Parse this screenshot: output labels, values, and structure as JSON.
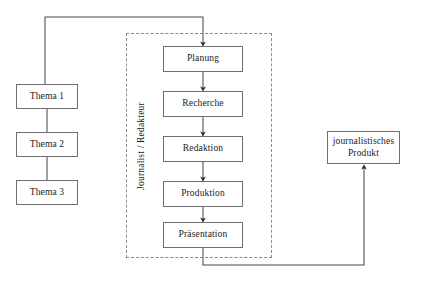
{
  "diagram": {
    "canvas": {
      "width": 425,
      "height": 283,
      "background": "#ffffff"
    },
    "style": {
      "box_stroke": "#6f6f6f",
      "connector_stroke": "#4a4a4a",
      "swimlane_stroke": "#8a8a8a",
      "text_color": "#1b1b1b"
    },
    "swimlane": {
      "label": "Journalist / Redakteur",
      "orientation": "vertical-rotated",
      "x": 126,
      "y": 33,
      "width": 146,
      "height": 225,
      "border": "dashed"
    },
    "topics": [
      {
        "id": "thema-1",
        "label": "Thema 1",
        "x": 16,
        "y": 84,
        "width": 62,
        "height": 25
      },
      {
        "id": "thema-2",
        "label": "Thema 2",
        "x": 16,
        "y": 132,
        "width": 62,
        "height": 25
      },
      {
        "id": "thema-3",
        "label": "Thema 3",
        "x": 16,
        "y": 180,
        "width": 62,
        "height": 25
      }
    ],
    "process_steps": [
      {
        "id": "planung",
        "label": "Planung",
        "x": 163,
        "y": 46,
        "width": 80,
        "height": 26
      },
      {
        "id": "recherche",
        "label": "Recherche",
        "x": 163,
        "y": 91,
        "width": 80,
        "height": 26
      },
      {
        "id": "redaktion",
        "label": "Redaktion",
        "x": 163,
        "y": 136,
        "width": 80,
        "height": 26
      },
      {
        "id": "produktion",
        "label": "Produktion",
        "x": 163,
        "y": 181,
        "width": 80,
        "height": 26
      },
      {
        "id": "praesentation",
        "label": "Präsentation",
        "x": 163,
        "y": 222,
        "width": 80,
        "height": 26
      }
    ],
    "output": {
      "id": "journalistisches-produkt",
      "label_line_1": "journalistisches",
      "label_line_2": "Produkt",
      "x": 327,
      "y": 131,
      "width": 73,
      "height": 33
    },
    "connectors": [
      {
        "id": "thema1-to-planung",
        "from": "thema-1",
        "to": "planung",
        "arrow": true,
        "path": "M 45 84 L 45 17 L 203 17 L 203 44"
      },
      {
        "id": "thema1-to-thema2",
        "from": "thema-1",
        "to": "thema-2",
        "arrow": false,
        "path": "M 47 109 L 47 132"
      },
      {
        "id": "thema2-to-thema3",
        "from": "thema-2",
        "to": "thema-3",
        "arrow": false,
        "path": "M 47 157 L 47 180"
      },
      {
        "id": "planung-to-recherche",
        "from": "planung",
        "to": "recherche",
        "arrow": true,
        "path": "M 203 72 L 203 89"
      },
      {
        "id": "recherche-to-redaktion",
        "from": "recherche",
        "to": "redaktion",
        "arrow": true,
        "path": "M 203 117 L 203 134"
      },
      {
        "id": "redaktion-to-produktion",
        "from": "redaktion",
        "to": "produktion",
        "arrow": true,
        "path": "M 203 162 L 203 179"
      },
      {
        "id": "produktion-to-praesentation",
        "from": "produktion",
        "to": "praesentation",
        "arrow": true,
        "path": "M 203 207 L 203 220"
      },
      {
        "id": "praesentation-to-produkt",
        "from": "praesentation",
        "to": "journalistisches-produkt",
        "arrow": true,
        "path": "M 203 248 L 203 265 L 364 265 L 364 167"
      }
    ]
  }
}
